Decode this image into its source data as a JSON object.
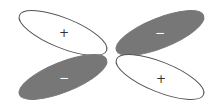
{
  "diagram": {
    "type": "d-orbital-lobes",
    "colors": {
      "positive_fill": "#ffffff",
      "negative_fill": "#777777",
      "stroke": "#555555",
      "positive_sign": "#333333",
      "negative_sign": "#ffffff"
    },
    "lobes": [
      {
        "position": "top-left",
        "phase": "positive",
        "sign": "+",
        "cx": 63,
        "cy": 33,
        "rx": 47,
        "ry": 15,
        "angle": 22
      },
      {
        "position": "top-right",
        "phase": "negative",
        "sign": "−",
        "cx": 160,
        "cy": 33,
        "rx": 47,
        "ry": 15,
        "angle": -22
      },
      {
        "position": "bottom-left",
        "phase": "negative",
        "sign": "−",
        "cx": 63,
        "cy": 77,
        "rx": 47,
        "ry": 15,
        "angle": -22
      },
      {
        "position": "bottom-right",
        "phase": "positive",
        "sign": "+",
        "cx": 160,
        "cy": 77,
        "rx": 47,
        "ry": 15,
        "angle": 22
      }
    ]
  }
}
